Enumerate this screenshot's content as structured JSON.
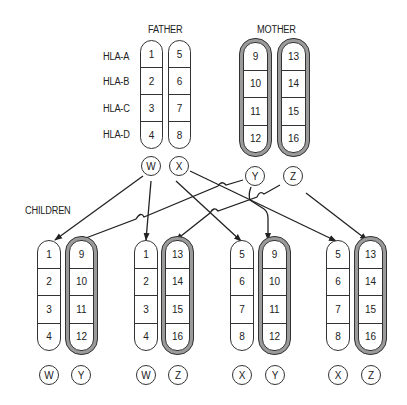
{
  "labels": {
    "father": "FATHER",
    "mother": "MOTHER",
    "children": "CHILDREN"
  },
  "hla_loci": [
    "HLA-A",
    "HLA-B",
    "HLA-C",
    "HLA-D"
  ],
  "parents": {
    "father": {
      "haplotypes": [
        {
          "name": "W",
          "alleles": [
            "1",
            "2",
            "3",
            "4"
          ]
        },
        {
          "name": "X",
          "alleles": [
            "5",
            "6",
            "7",
            "8"
          ]
        }
      ]
    },
    "mother": {
      "haplotypes": [
        {
          "name": "Y",
          "alleles": [
            "9",
            "10",
            "11",
            "12"
          ]
        },
        {
          "name": "Z",
          "alleles": [
            "13",
            "14",
            "15",
            "16"
          ]
        }
      ]
    }
  },
  "children": [
    {
      "paternal": {
        "name": "W",
        "alleles": [
          "1",
          "2",
          "3",
          "4"
        ]
      },
      "maternal": {
        "name": "Y",
        "alleles": [
          "9",
          "10",
          "11",
          "12"
        ]
      }
    },
    {
      "paternal": {
        "name": "W",
        "alleles": [
          "1",
          "2",
          "3",
          "4"
        ]
      },
      "maternal": {
        "name": "Z",
        "alleles": [
          "13",
          "14",
          "15",
          "16"
        ]
      }
    },
    {
      "paternal": {
        "name": "X",
        "alleles": [
          "5",
          "6",
          "7",
          "8"
        ]
      },
      "maternal": {
        "name": "Y",
        "alleles": [
          "9",
          "10",
          "11",
          "12"
        ]
      }
    },
    {
      "paternal": {
        "name": "X",
        "alleles": [
          "5",
          "6",
          "7",
          "8"
        ]
      },
      "maternal": {
        "name": "Z",
        "alleles": [
          "13",
          "14",
          "15",
          "16"
        ]
      }
    }
  ],
  "colors": {
    "line": "#222222",
    "maternal_shading": "#9a9a9a"
  }
}
